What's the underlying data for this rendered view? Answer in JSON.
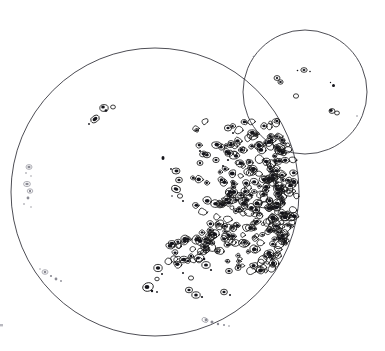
{
  "figure": {
    "domain_label": "solar-disk-spot-map",
    "title": "",
    "description": "Two overlapping circular disk outlines drawn in thin dark ink on a white background. The large disk on the left occupies most of the frame; a smaller disk overlaps it at the upper right. Both disks are stippled with small closed contour outlines representing spot groups.",
    "style": {
      "background_color": "#ffffff",
      "limb_stroke_color": "#3a3a42",
      "spot_stroke_color": "#1a1a1a",
      "spot_core_color": "#14141a",
      "faint_spot_color": "#8d8d96",
      "limb_stroke_width": 0.9,
      "spot_stroke_width": 0.85
    },
    "disks": [
      {
        "id": "primary-disk",
        "name": "large-disk",
        "center_x": 155,
        "center_y": 192,
        "radius": 144,
        "note": "large left disk, clipped at left edge of frame"
      },
      {
        "id": "secondary-disk",
        "name": "small-disk",
        "center_x": 305,
        "center_y": 92,
        "radius": 62,
        "note": "smaller disk overlapping upper right of the large disk"
      }
    ],
    "groups": [
      {
        "id": "g-dense-main",
        "label": "dense central-east cluster",
        "disk": "primary-disk",
        "density": "very-high",
        "approx_center": [
          248,
          196
        ],
        "approx_extent": [
          110,
          150
        ],
        "blob_count": 300
      },
      {
        "id": "g-arc-upper",
        "label": "upper arc of cluster",
        "disk": "primary-disk",
        "density": "high",
        "approx_center": [
          214,
          152
        ],
        "approx_extent": [
          48,
          40
        ],
        "blob_count": 26
      },
      {
        "id": "g-arm-southwest",
        "label": "south-west arm of cluster",
        "disk": "primary-disk",
        "density": "medium",
        "approx_center": [
          205,
          244
        ],
        "approx_extent": [
          70,
          48
        ],
        "blob_count": 60
      },
      {
        "id": "g-chain-mid",
        "label": "mid-disk vertical chain",
        "disk": "primary-disk",
        "density": "low",
        "approx_center": [
          177,
          182
        ],
        "approx_extent": [
          16,
          38
        ],
        "blob_count": 9
      },
      {
        "id": "g-dot-mid",
        "label": "isolated mid-disk dot",
        "disk": "primary-disk",
        "density": "single",
        "approx_center": [
          163,
          158
        ],
        "approx_extent": [
          3,
          3
        ],
        "blob_count": 1
      },
      {
        "id": "g-northwest",
        "label": "north-west group",
        "disk": "primary-disk",
        "density": "low",
        "approx_center": [
          101,
          112
        ],
        "approx_extent": [
          26,
          22
        ],
        "blob_count": 6
      },
      {
        "id": "g-west-limb",
        "label": "west limb foreshortened chain",
        "disk": "primary-disk",
        "density": "faint",
        "approx_center": [
          26,
          186
        ],
        "approx_extent": [
          14,
          46
        ],
        "blob_count": 10
      },
      {
        "id": "g-southwest-limb",
        "label": "south-west limb faint marks",
        "disk": "primary-disk",
        "density": "faint",
        "approx_center": [
          51,
          276
        ],
        "approx_extent": [
          22,
          10
        ],
        "blob_count": 6
      },
      {
        "id": "g-south-scatter",
        "label": "southern scattered groups",
        "disk": "primary-disk",
        "density": "low",
        "approx_center": [
          160,
          282
        ],
        "approx_extent": [
          50,
          34
        ],
        "blob_count": 10
      },
      {
        "id": "g-south-limb",
        "label": "south limb faint marks",
        "disk": "primary-disk",
        "density": "faint",
        "approx_center": [
          215,
          322
        ],
        "approx_extent": [
          28,
          8
        ],
        "blob_count": 6
      },
      {
        "id": "g-small-disk-spots",
        "label": "small disk sparse groups",
        "disk": "secondary-disk",
        "density": "sparse",
        "approx_center": [
          305,
          92
        ],
        "approx_extent": [
          90,
          70
        ],
        "blob_count": 9
      }
    ],
    "marks": [
      {
        "id": "edge-tick-left",
        "label": "faint tick at left frame edge",
        "x": 1,
        "y": 325
      }
    ]
  }
}
